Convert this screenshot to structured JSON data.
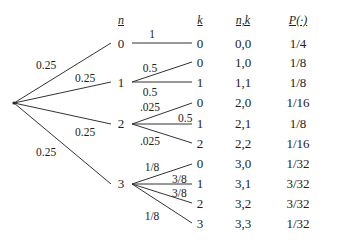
{
  "headers": {
    "n": "n",
    "k": "k",
    "nk": "n,k",
    "p": "P(·)"
  },
  "first_level": {
    "root": "root-node",
    "branches": [
      {
        "n": "0",
        "prob": "0.25"
      },
      {
        "n": "1",
        "prob": "0.25"
      },
      {
        "n": "2",
        "prob": "0.25"
      },
      {
        "n": "3",
        "prob": "0.25"
      }
    ]
  },
  "second_level": [
    {
      "n": "0",
      "edges": [
        {
          "k": "0",
          "prob": "1"
        }
      ]
    },
    {
      "n": "1",
      "edges": [
        {
          "k": "0",
          "prob": "0.5"
        },
        {
          "k": "1",
          "prob": "0.5"
        }
      ]
    },
    {
      "n": "2",
      "edges": [
        {
          "k": "0",
          "prob": ".025"
        },
        {
          "k": "1",
          "prob": "0.5"
        },
        {
          "k": "2",
          "prob": ".025"
        }
      ]
    },
    {
      "n": "3",
      "edges": [
        {
          "k": "0",
          "prob": "1/8"
        },
        {
          "k": "1",
          "prob": "3/8"
        },
        {
          "k": "2",
          "prob": "3/8"
        },
        {
          "k": "3",
          "prob": "1/8"
        }
      ]
    }
  ],
  "table": [
    {
      "k": "0",
      "nk": "0,0",
      "p": "1/4"
    },
    {
      "k": "0",
      "nk": "1,0",
      "p": "1/8"
    },
    {
      "k": "1",
      "nk": "1,1",
      "p": "1/8"
    },
    {
      "k": "0",
      "nk": "2,0",
      "p": "1/16"
    },
    {
      "k": "1",
      "nk": "2,1",
      "p": "1/8"
    },
    {
      "k": "2",
      "nk": "2,2",
      "p": "1/16"
    },
    {
      "k": "0",
      "nk": "3,0",
      "p": "1/32"
    },
    {
      "k": "1",
      "nk": "3,1",
      "p": "3/32"
    },
    {
      "k": "2",
      "nk": "3,2",
      "p": "3/32"
    },
    {
      "k": "3",
      "nk": "3,3",
      "p": "1/32"
    }
  ]
}
